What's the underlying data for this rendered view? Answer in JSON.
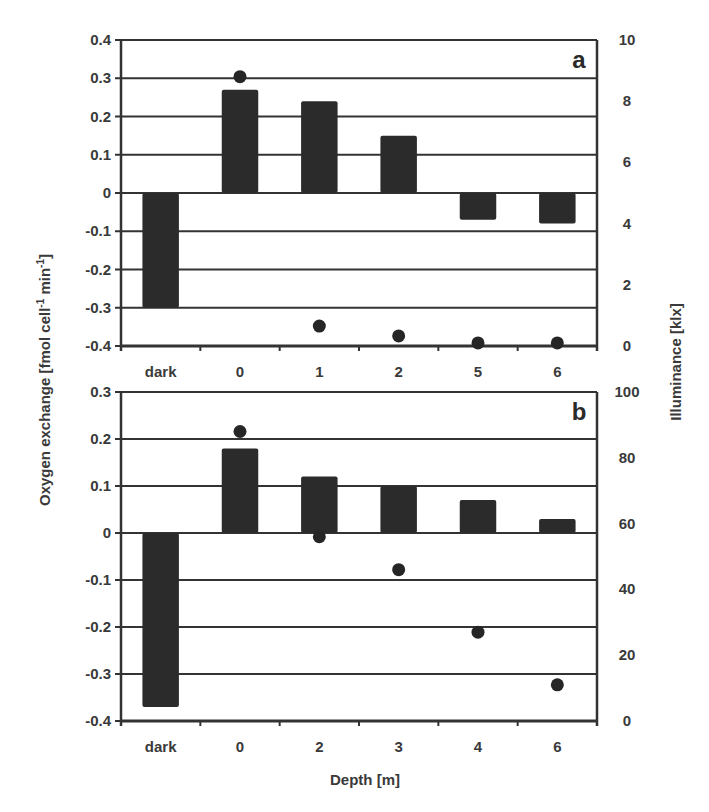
{
  "chart_data": [
    {
      "panel": "a",
      "type": "bar",
      "overlay_type": "scatter",
      "categories": [
        "dark",
        "0",
        "1",
        "2",
        "5",
        "6"
      ],
      "series": [
        {
          "name": "Oxygen exchange",
          "axis": "left",
          "mark": "bar",
          "values": [
            -0.3,
            0.27,
            0.24,
            0.15,
            -0.07,
            -0.08
          ]
        },
        {
          "name": "Illuminance",
          "axis": "right",
          "mark": "dot",
          "values": [
            null,
            8.8,
            0.65,
            0.33,
            0.1,
            0.1
          ]
        }
      ],
      "ylim": [
        -0.4,
        0.4
      ],
      "yticks": [
        "0.4",
        "0.3",
        "0.2",
        "0.1",
        "0",
        "-0.1",
        "-0.2",
        "-0.3",
        "-0.4"
      ],
      "y2lim": [
        0,
        10
      ],
      "y2ticks": [
        "10",
        "8",
        "6",
        "4",
        "2",
        "0"
      ],
      "grid": true,
      "label": "a"
    },
    {
      "panel": "b",
      "type": "bar",
      "overlay_type": "scatter",
      "categories": [
        "dark",
        "0",
        "2",
        "3",
        "4",
        "6"
      ],
      "series": [
        {
          "name": "Oxygen exchange",
          "axis": "left",
          "mark": "bar",
          "values": [
            -0.37,
            0.18,
            0.12,
            0.1,
            0.07,
            0.03
          ]
        },
        {
          "name": "Illuminance",
          "axis": "right",
          "mark": "dot",
          "values": [
            null,
            88,
            56,
            46,
            27,
            11
          ]
        }
      ],
      "ylim": [
        -0.4,
        0.3
      ],
      "yticks": [
        "0.3",
        "0.2",
        "0.1",
        "0",
        "-0.1",
        "-0.2",
        "-0.3",
        "-0.4"
      ],
      "y2lim": [
        0,
        100
      ],
      "y2ticks": [
        "100",
        "80",
        "60",
        "40",
        "20",
        "0"
      ],
      "grid": true,
      "label": "b"
    }
  ],
  "axes": {
    "ylabel": "Oxygen exchange [fmol cell",
    "ylabel_sup1": "-1",
    "ylabel_mid": " min",
    "ylabel_sup2": "-1",
    "ylabel_end": "]",
    "y2label": "Illuminance [klx]",
    "xlabel": "Depth [m]"
  },
  "colors": {
    "bar": "#2b2b2b",
    "dot": "#262626",
    "grid": "#333333",
    "text": "#3a3a3a"
  }
}
